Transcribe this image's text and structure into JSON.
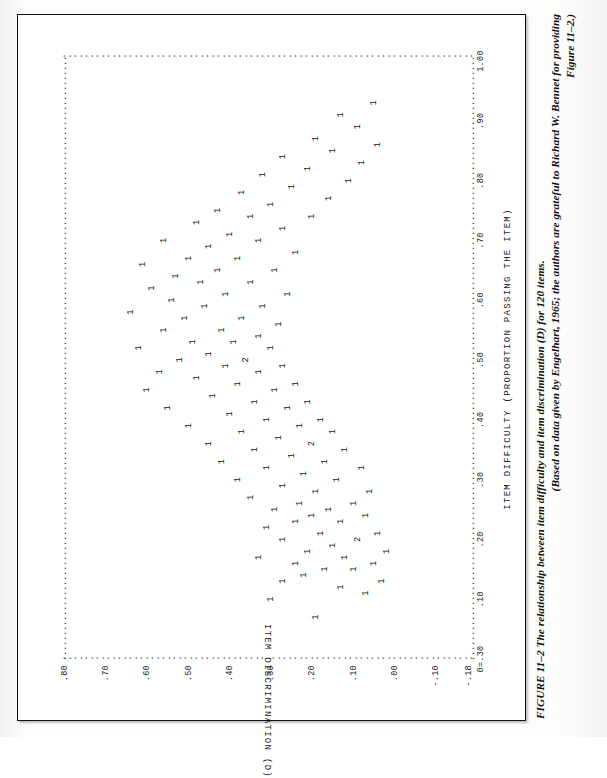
{
  "figure": {
    "caption_line1": "FIGURE 11–2   The relationship between item difficulty and item discrimination (D) for 120 items.",
    "caption_line2": "(Based on data given by Engelhart, 1965; the authors are grateful to Richard W. Bennet for providing",
    "caption_line3": "Figure 11–2.)",
    "frame_color": "#111111"
  },
  "chart_data": {
    "type": "scatter",
    "title": "",
    "xlabel": "ITEM DIFFICULTY (PROPORTION PASSING THE ITEM)",
    "ylabel": "ITEM DISCRIMINATION (D)",
    "origin_label": "0=.30",
    "xlim": [
      0.0,
      1.0
    ],
    "ylim": [
      -0.18,
      0.8
    ],
    "grid": false,
    "legend": null,
    "n_items": 120,
    "marker_glyph": "1",
    "marker_note": "count of coincident points printed as digit",
    "xticks": [
      0.0,
      0.1,
      0.2,
      0.3,
      0.4,
      0.5,
      0.6,
      0.7,
      0.8,
      0.9,
      1.0
    ],
    "xticklabels": [
      "0=.30",
      ".10",
      ".20",
      ".30",
      ".40",
      ".50",
      ".60",
      ".70",
      ".80",
      ".90",
      "1.00"
    ],
    "yticks": [
      -0.18,
      -0.1,
      0.0,
      0.1,
      0.2,
      0.3,
      0.4,
      0.5,
      0.6,
      0.7,
      0.8
    ],
    "yticklabels": [
      "-.18",
      "-.10",
      ".00",
      ".10",
      ".20",
      ".30",
      ".40",
      ".50",
      ".60",
      ".70",
      ".80"
    ],
    "points": [
      {
        "x": 0.07,
        "y": 0.19,
        "n": 1
      },
      {
        "x": 0.1,
        "y": 0.3,
        "n": 1
      },
      {
        "x": 0.11,
        "y": 0.07,
        "n": 1
      },
      {
        "x": 0.12,
        "y": 0.13,
        "n": 1
      },
      {
        "x": 0.13,
        "y": 0.03,
        "n": 1
      },
      {
        "x": 0.13,
        "y": 0.27,
        "n": 1
      },
      {
        "x": 0.14,
        "y": 0.22,
        "n": 1
      },
      {
        "x": 0.15,
        "y": 0.1,
        "n": 1
      },
      {
        "x": 0.15,
        "y": 0.17,
        "n": 1
      },
      {
        "x": 0.16,
        "y": 0.05,
        "n": 1
      },
      {
        "x": 0.16,
        "y": 0.24,
        "n": 1
      },
      {
        "x": 0.17,
        "y": 0.12,
        "n": 1
      },
      {
        "x": 0.17,
        "y": 0.33,
        "n": 1
      },
      {
        "x": 0.18,
        "y": 0.02,
        "n": 1
      },
      {
        "x": 0.18,
        "y": 0.21,
        "n": 1
      },
      {
        "x": 0.19,
        "y": 0.15,
        "n": 1
      },
      {
        "x": 0.2,
        "y": 0.09,
        "n": 2
      },
      {
        "x": 0.2,
        "y": 0.27,
        "n": 1
      },
      {
        "x": 0.21,
        "y": 0.04,
        "n": 1
      },
      {
        "x": 0.21,
        "y": 0.18,
        "n": 1
      },
      {
        "x": 0.22,
        "y": 0.31,
        "n": 1
      },
      {
        "x": 0.23,
        "y": 0.13,
        "n": 1
      },
      {
        "x": 0.23,
        "y": 0.24,
        "n": 1
      },
      {
        "x": 0.24,
        "y": 0.07,
        "n": 1
      },
      {
        "x": 0.24,
        "y": 0.2,
        "n": 1
      },
      {
        "x": 0.25,
        "y": 0.16,
        "n": 1
      },
      {
        "x": 0.25,
        "y": 0.29,
        "n": 1
      },
      {
        "x": 0.26,
        "y": 0.1,
        "n": 1
      },
      {
        "x": 0.26,
        "y": 0.23,
        "n": 1
      },
      {
        "x": 0.27,
        "y": 0.35,
        "n": 1
      },
      {
        "x": 0.28,
        "y": 0.06,
        "n": 1
      },
      {
        "x": 0.28,
        "y": 0.19,
        "n": 1
      },
      {
        "x": 0.29,
        "y": 0.27,
        "n": 1
      },
      {
        "x": 0.3,
        "y": 0.14,
        "n": 1
      },
      {
        "x": 0.3,
        "y": 0.38,
        "n": 1
      },
      {
        "x": 0.31,
        "y": 0.22,
        "n": 1
      },
      {
        "x": 0.32,
        "y": 0.08,
        "n": 1
      },
      {
        "x": 0.32,
        "y": 0.31,
        "n": 1
      },
      {
        "x": 0.33,
        "y": 0.17,
        "n": 1
      },
      {
        "x": 0.33,
        "y": 0.42,
        "n": 1
      },
      {
        "x": 0.34,
        "y": 0.25,
        "n": 1
      },
      {
        "x": 0.35,
        "y": 0.12,
        "n": 1
      },
      {
        "x": 0.35,
        "y": 0.34,
        "n": 1
      },
      {
        "x": 0.36,
        "y": 0.2,
        "n": 2
      },
      {
        "x": 0.36,
        "y": 0.45,
        "n": 1
      },
      {
        "x": 0.37,
        "y": 0.28,
        "n": 1
      },
      {
        "x": 0.38,
        "y": 0.15,
        "n": 1
      },
      {
        "x": 0.38,
        "y": 0.37,
        "n": 1
      },
      {
        "x": 0.39,
        "y": 0.23,
        "n": 1
      },
      {
        "x": 0.39,
        "y": 0.5,
        "n": 1
      },
      {
        "x": 0.4,
        "y": 0.31,
        "n": 1
      },
      {
        "x": 0.4,
        "y": 0.18,
        "n": 1
      },
      {
        "x": 0.41,
        "y": 0.4,
        "n": 1
      },
      {
        "x": 0.42,
        "y": 0.26,
        "n": 1
      },
      {
        "x": 0.42,
        "y": 0.55,
        "n": 1
      },
      {
        "x": 0.43,
        "y": 0.34,
        "n": 1
      },
      {
        "x": 0.43,
        "y": 0.21,
        "n": 1
      },
      {
        "x": 0.44,
        "y": 0.44,
        "n": 1
      },
      {
        "x": 0.45,
        "y": 0.29,
        "n": 1
      },
      {
        "x": 0.45,
        "y": 0.6,
        "n": 1
      },
      {
        "x": 0.46,
        "y": 0.38,
        "n": 1
      },
      {
        "x": 0.46,
        "y": 0.24,
        "n": 1
      },
      {
        "x": 0.47,
        "y": 0.48,
        "n": 1
      },
      {
        "x": 0.48,
        "y": 0.33,
        "n": 1
      },
      {
        "x": 0.48,
        "y": 0.57,
        "n": 1
      },
      {
        "x": 0.49,
        "y": 0.41,
        "n": 1
      },
      {
        "x": 0.49,
        "y": 0.27,
        "n": 1
      },
      {
        "x": 0.5,
        "y": 0.52,
        "n": 1
      },
      {
        "x": 0.5,
        "y": 0.36,
        "n": 2
      },
      {
        "x": 0.51,
        "y": 0.45,
        "n": 1
      },
      {
        "x": 0.52,
        "y": 0.3,
        "n": 1
      },
      {
        "x": 0.52,
        "y": 0.62,
        "n": 1
      },
      {
        "x": 0.53,
        "y": 0.39,
        "n": 1
      },
      {
        "x": 0.53,
        "y": 0.49,
        "n": 1
      },
      {
        "x": 0.54,
        "y": 0.33,
        "n": 1
      },
      {
        "x": 0.55,
        "y": 0.56,
        "n": 1
      },
      {
        "x": 0.55,
        "y": 0.42,
        "n": 1
      },
      {
        "x": 0.56,
        "y": 0.28,
        "n": 1
      },
      {
        "x": 0.57,
        "y": 0.51,
        "n": 1
      },
      {
        "x": 0.57,
        "y": 0.37,
        "n": 1
      },
      {
        "x": 0.58,
        "y": 0.64,
        "n": 1
      },
      {
        "x": 0.59,
        "y": 0.46,
        "n": 1
      },
      {
        "x": 0.59,
        "y": 0.32,
        "n": 1
      },
      {
        "x": 0.6,
        "y": 0.54,
        "n": 1
      },
      {
        "x": 0.61,
        "y": 0.41,
        "n": 1
      },
      {
        "x": 0.61,
        "y": 0.26,
        "n": 1
      },
      {
        "x": 0.62,
        "y": 0.59,
        "n": 1
      },
      {
        "x": 0.63,
        "y": 0.47,
        "n": 1
      },
      {
        "x": 0.63,
        "y": 0.35,
        "n": 1
      },
      {
        "x": 0.64,
        "y": 0.53,
        "n": 1
      },
      {
        "x": 0.65,
        "y": 0.29,
        "n": 1
      },
      {
        "x": 0.65,
        "y": 0.43,
        "n": 1
      },
      {
        "x": 0.66,
        "y": 0.61,
        "n": 1
      },
      {
        "x": 0.67,
        "y": 0.38,
        "n": 1
      },
      {
        "x": 0.67,
        "y": 0.5,
        "n": 1
      },
      {
        "x": 0.68,
        "y": 0.24,
        "n": 1
      },
      {
        "x": 0.69,
        "y": 0.45,
        "n": 1
      },
      {
        "x": 0.7,
        "y": 0.33,
        "n": 1
      },
      {
        "x": 0.7,
        "y": 0.56,
        "n": 1
      },
      {
        "x": 0.71,
        "y": 0.4,
        "n": 1
      },
      {
        "x": 0.72,
        "y": 0.27,
        "n": 1
      },
      {
        "x": 0.73,
        "y": 0.48,
        "n": 1
      },
      {
        "x": 0.74,
        "y": 0.35,
        "n": 1
      },
      {
        "x": 0.74,
        "y": 0.2,
        "n": 1
      },
      {
        "x": 0.75,
        "y": 0.43,
        "n": 1
      },
      {
        "x": 0.76,
        "y": 0.3,
        "n": 1
      },
      {
        "x": 0.77,
        "y": 0.16,
        "n": 1
      },
      {
        "x": 0.78,
        "y": 0.37,
        "n": 1
      },
      {
        "x": 0.79,
        "y": 0.25,
        "n": 1
      },
      {
        "x": 0.8,
        "y": 0.11,
        "n": 1
      },
      {
        "x": 0.81,
        "y": 0.32,
        "n": 1
      },
      {
        "x": 0.82,
        "y": 0.21,
        "n": 1
      },
      {
        "x": 0.83,
        "y": 0.08,
        "n": 1
      },
      {
        "x": 0.84,
        "y": 0.27,
        "n": 1
      },
      {
        "x": 0.85,
        "y": 0.15,
        "n": 1
      },
      {
        "x": 0.86,
        "y": 0.04,
        "n": 1
      },
      {
        "x": 0.87,
        "y": 0.19,
        "n": 1
      },
      {
        "x": 0.89,
        "y": 0.09,
        "n": 1
      },
      {
        "x": 0.91,
        "y": 0.13,
        "n": 1
      },
      {
        "x": 0.93,
        "y": 0.05,
        "n": 1
      }
    ]
  }
}
